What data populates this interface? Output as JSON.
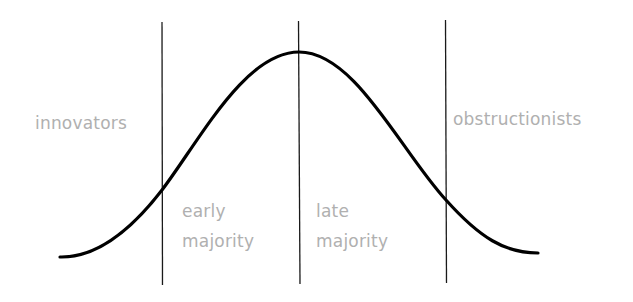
{
  "diagram": {
    "type": "bell-curve-segments",
    "labels": {
      "innovators": "innovators",
      "early_majority_1": "early",
      "early_majority_2": "majority",
      "late_majority_1": "late",
      "late_majority_2": "majority",
      "obstructionists": "obstructionists"
    },
    "colors": {
      "curve": "#000000",
      "divider": "#1a1a1a",
      "label": "#b0b0b0",
      "background": "#ffffff"
    },
    "segments": [
      "innovators",
      "early majority",
      "late majority",
      "obstructionists"
    ]
  }
}
